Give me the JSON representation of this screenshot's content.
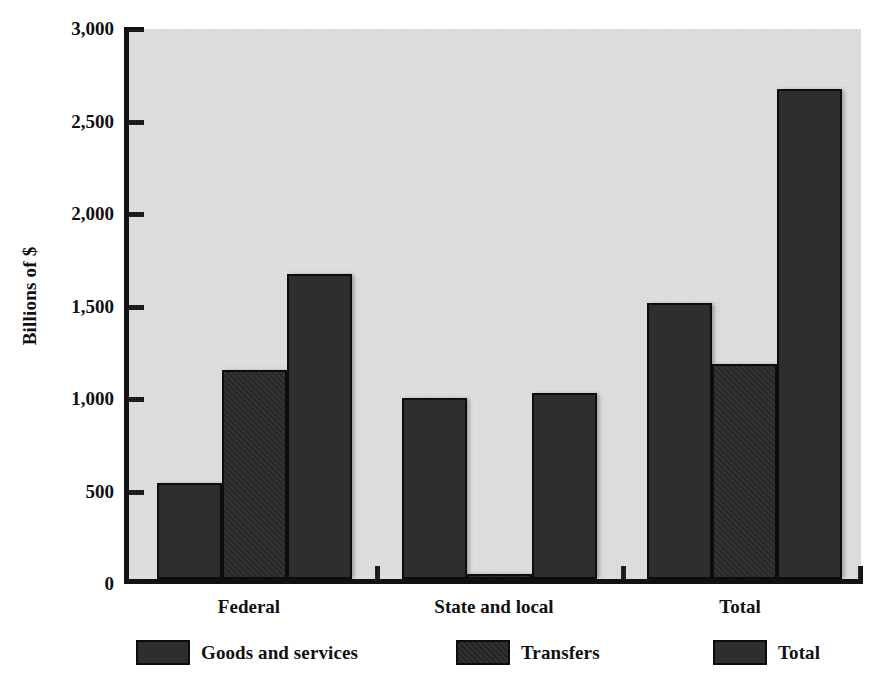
{
  "chart_data": {
    "type": "bar",
    "title": "",
    "subtitle": "",
    "xlabel": "",
    "ylabel": "Billions of $",
    "ylim": [
      0,
      3000
    ],
    "yticks": [
      0,
      500,
      1000,
      1500,
      2000,
      2500,
      3000
    ],
    "ytick_labels": [
      "0",
      "500",
      "1,000",
      "1,500",
      "2,000",
      "2,500",
      "3,000"
    ],
    "grid": false,
    "legend_position": "bottom",
    "categories": [
      "Federal",
      "State and local",
      "Total"
    ],
    "series": [
      {
        "name": "Goods and services",
        "values": [
          525,
          985,
          1508
        ]
      },
      {
        "name": "Transfers",
        "values": [
          1140,
          30,
          1172
        ]
      },
      {
        "name": "Total",
        "values": [
          1665,
          1015,
          2675
        ]
      }
    ],
    "annotations": []
  },
  "legend": {
    "items": [
      {
        "label": "Goods and services",
        "swatch": "dark-gray"
      },
      {
        "label": "Transfers",
        "swatch": "dark-gray-textured"
      },
      {
        "label": "Total",
        "swatch": "dark-gray"
      }
    ]
  },
  "colors": {
    "bar_fill": "#2e2e2e",
    "bar_stroke": "#0d0d0d",
    "plot_background": "#dededc",
    "axis": "#121212",
    "page_background": "#ffffff",
    "text": "#111111"
  }
}
